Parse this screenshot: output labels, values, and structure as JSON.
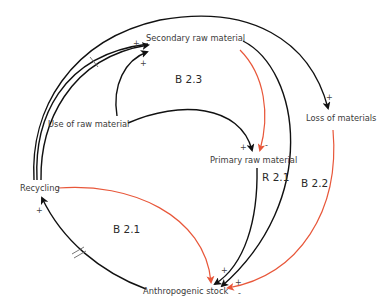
{
  "nodes": {
    "secondary": "Secondary raw material",
    "use": "Use of raw material",
    "loss": "Loss of materials",
    "primary": "Primary raw material",
    "recycling": "Recycling",
    "stock": "Anthropogenic stock"
  },
  "loops": {
    "b23": "B 2.3",
    "r21": "R 2.1",
    "b22": "B 2.2",
    "b21": "B 2.1"
  },
  "signs": {
    "rec_to_sec": "+",
    "use_to_sec": "+",
    "out_to_loss": "+",
    "use_to_prim": "+",
    "sec_to_prim": "-",
    "prim_to_stock": "+",
    "sec_to_stock": "+",
    "loss_to_stock": "-",
    "stock_to_rec": "+"
  },
  "colors": {
    "positive_link": "#111111",
    "negative_link": "#e8573a"
  }
}
